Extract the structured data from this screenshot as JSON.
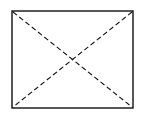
{
  "diagram": {
    "shape": "rectangle-with-dashed-diagonals",
    "rect": {
      "x": 12,
      "y": 11,
      "width": 121,
      "height": 97
    },
    "stroke_color": "#111111",
    "background": "#ffffff",
    "diagonal_style": "dashed"
  }
}
